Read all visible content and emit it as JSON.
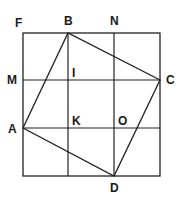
{
  "diagram": {
    "type": "geometry",
    "stroke_color": "#222222",
    "points": {
      "F": {
        "label": "F",
        "x": 23,
        "y": 33
      },
      "B": {
        "label": "B",
        "x": 68,
        "y": 33
      },
      "N": {
        "label": "N",
        "x": 114,
        "y": 33
      },
      "M": {
        "label": "M",
        "x": 23,
        "y": 80
      },
      "I": {
        "label": "I",
        "x": 68,
        "y": 80
      },
      "C": {
        "label": "C",
        "x": 160,
        "y": 80
      },
      "A": {
        "label": "A",
        "x": 23,
        "y": 128
      },
      "K": {
        "label": "K",
        "x": 68,
        "y": 128
      },
      "O": {
        "label": "O",
        "x": 114,
        "y": 128
      },
      "D": {
        "label": "D",
        "x": 114,
        "y": 176
      }
    },
    "outer_square": {
      "x1": 23,
      "y1": 33,
      "x2": 160,
      "y2": 176
    },
    "grid_lines": {
      "vertical": [
        68,
        114
      ],
      "horizontal": [
        80,
        128
      ]
    },
    "quadrilateral": [
      "A",
      "B",
      "C",
      "D"
    ],
    "labels": {
      "F": "F",
      "B": "B",
      "N": "N",
      "M": "M",
      "I": "I",
      "C": "C",
      "A": "A",
      "K": "K",
      "O": "O",
      "D": "D"
    }
  }
}
